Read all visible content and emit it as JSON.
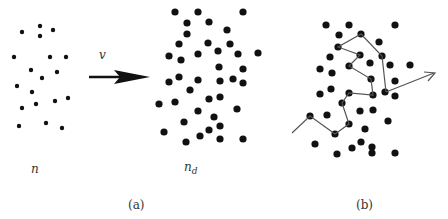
{
  "labels": {
    "velocity": "v",
    "density_before": "n",
    "density_after": "n",
    "density_after_sub": "d",
    "panel_a": "(a)",
    "panel_b": "(b)"
  },
  "colors": {
    "dot": "#111111",
    "arrow": "#111111",
    "path": "#555555",
    "text": "#333333"
  },
  "panel_a_left_dots": [
    [
      22,
      32
    ],
    [
      40,
      26
    ],
    [
      40,
      36
    ],
    [
      53,
      30
    ],
    [
      14,
      57
    ],
    [
      50,
      57
    ],
    [
      66,
      57
    ],
    [
      31,
      70
    ],
    [
      57,
      72
    ],
    [
      42,
      78
    ],
    [
      17,
      86
    ],
    [
      32,
      92
    ],
    [
      55,
      101
    ],
    [
      68,
      98
    ],
    [
      22,
      108
    ],
    [
      36,
      104
    ],
    [
      19,
      126
    ],
    [
      46,
      123
    ],
    [
      62,
      128
    ]
  ],
  "panel_a_right_dots": [
    [
      175,
      12
    ],
    [
      198,
      12
    ],
    [
      243,
      12
    ],
    [
      187,
      23
    ],
    [
      209,
      22
    ],
    [
      227,
      30
    ],
    [
      187,
      34
    ],
    [
      179,
      44
    ],
    [
      208,
      43
    ],
    [
      230,
      44
    ],
    [
      169,
      56
    ],
    [
      181,
      60
    ],
    [
      198,
      54
    ],
    [
      218,
      51
    ],
    [
      238,
      54
    ],
    [
      258,
      53
    ],
    [
      219,
      67
    ],
    [
      243,
      69
    ],
    [
      169,
      82
    ],
    [
      179,
      77
    ],
    [
      198,
      80
    ],
    [
      220,
      81
    ],
    [
      233,
      79
    ],
    [
      243,
      83
    ],
    [
      190,
      90
    ],
    [
      209,
      99
    ],
    [
      220,
      97
    ],
    [
      159,
      104
    ],
    [
      175,
      102
    ],
    [
      198,
      111
    ],
    [
      237,
      109
    ],
    [
      184,
      122
    ],
    [
      214,
      117
    ],
    [
      164,
      132
    ],
    [
      209,
      130
    ],
    [
      220,
      126
    ],
    [
      186,
      142
    ],
    [
      200,
      136
    ],
    [
      220,
      139
    ],
    [
      243,
      139
    ]
  ],
  "panel_b_dots": [
    [
      326,
      25
    ],
    [
      349,
      25
    ],
    [
      395,
      25
    ],
    [
      339,
      35
    ],
    [
      361,
      34
    ],
    [
      379,
      42
    ],
    [
      338,
      47
    ],
    [
      330,
      57
    ],
    [
      360,
      55
    ],
    [
      382,
      56
    ],
    [
      320,
      69
    ],
    [
      332,
      73
    ],
    [
      349,
      66
    ],
    [
      370,
      63
    ],
    [
      390,
      65
    ],
    [
      410,
      65
    ],
    [
      371,
      79
    ],
    [
      395,
      81
    ],
    [
      320,
      94
    ],
    [
      331,
      89
    ],
    [
      349,
      93
    ],
    [
      373,
      95
    ],
    [
      385,
      92
    ],
    [
      395,
      96
    ],
    [
      342,
      103
    ],
    [
      360,
      111
    ],
    [
      373,
      110
    ],
    [
      310,
      116
    ],
    [
      327,
      115
    ],
    [
      349,
      124
    ],
    [
      388,
      121
    ],
    [
      335,
      134
    ],
    [
      365,
      129
    ],
    [
      315,
      144
    ],
    [
      352,
      148
    ],
    [
      361,
      142
    ],
    [
      337,
      154
    ],
    [
      372,
      147
    ],
    [
      372,
      153
    ],
    [
      395,
      153
    ]
  ],
  "panel_b_path": [
    [
      292,
      133
    ],
    [
      310,
      116
    ],
    [
      335,
      134
    ],
    [
      349,
      124
    ],
    [
      342,
      103
    ],
    [
      349,
      93
    ],
    [
      373,
      95
    ],
    [
      371,
      79
    ],
    [
      349,
      66
    ],
    [
      360,
      55
    ],
    [
      338,
      47
    ],
    [
      361,
      34
    ],
    [
      382,
      56
    ],
    [
      386,
      92
    ]
  ]
}
